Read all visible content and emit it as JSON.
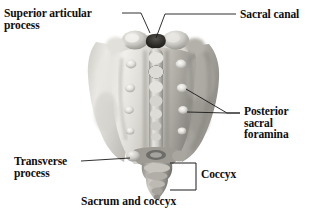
{
  "figure": {
    "title": "Sacrum and coccyx",
    "view": "posterior view of sacrum and coccyx",
    "background_color": "#ffffff",
    "text_color": "#0d0d0d",
    "leader_line_color": "#1a1a1a",
    "bone_light_color": "#efeeea",
    "bone_mid_color": "#b9b7b1",
    "bone_shadow_color": "#7c7a76",
    "foramen_color": "#2e2c2a"
  },
  "labels": [
    {
      "id": "superior-articular-process",
      "text": "Superior articular\nprocess",
      "x": 4,
      "y": 8,
      "align": "left"
    },
    {
      "id": "sacral-canal",
      "text": "Sacral canal",
      "x": 240,
      "y": 9,
      "align": "left"
    },
    {
      "id": "posterior-sacral-foramina",
      "text": "Posterior\nsacral\nforamina",
      "x": 244,
      "y": 106,
      "align": "left"
    },
    {
      "id": "transverse-process",
      "text": "Transverse\nprocess",
      "x": 14,
      "y": 156,
      "align": "left"
    },
    {
      "id": "coccyx",
      "text": "Coccyx",
      "x": 201,
      "y": 169,
      "align": "left"
    }
  ],
  "caption": {
    "text": "Sacrum and coccyx",
    "x": 81,
    "y": 195
  },
  "anatomy": {
    "structures": [
      "superior articular process",
      "sacral canal",
      "median sacral crest",
      "posterior sacral foramina",
      "transverse process",
      "sacral hiatus",
      "coccyx"
    ],
    "foramina_per_side": 4,
    "coccyx_segments": 4
  }
}
